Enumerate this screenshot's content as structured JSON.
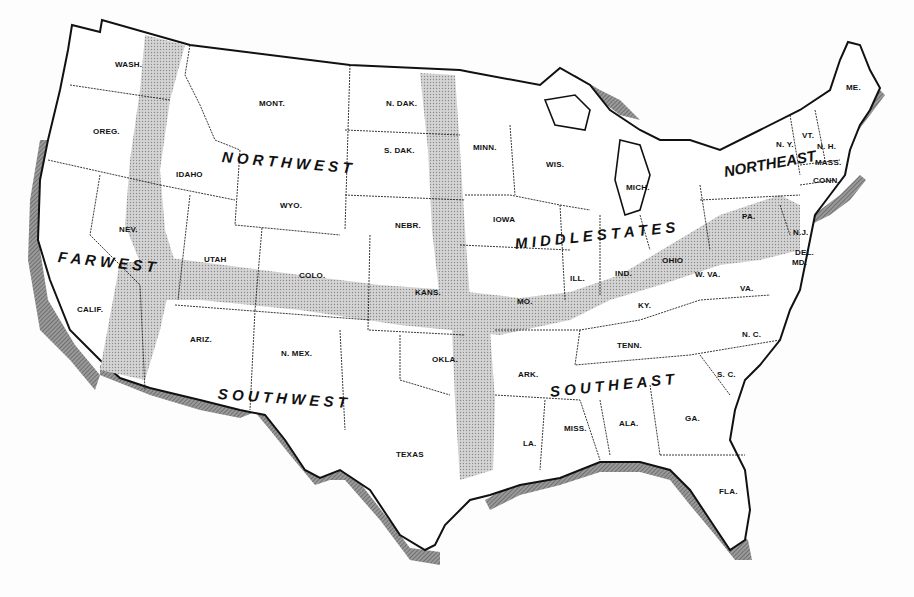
{
  "map": {
    "title": "",
    "colors": {
      "land": "#ffffff",
      "border": "#111111",
      "transition_band": "#c8c8c8",
      "water_shading": "#888888",
      "background": "#fdfdfd"
    },
    "regions": [
      {
        "id": "northwest",
        "label": "N O R T H W E S T",
        "x": 222,
        "y": 148,
        "rotate": 5
      },
      {
        "id": "far_west",
        "label": "F A R  W E S T",
        "x": 58,
        "y": 248,
        "rotate": 6
      },
      {
        "id": "southwest",
        "label": "S O U T H W E S T",
        "x": 218,
        "y": 385,
        "rotate": 4
      },
      {
        "id": "middle_states",
        "label": "M I D D L E   S T A T E S",
        "x": 515,
        "y": 235,
        "rotate": -6
      },
      {
        "id": "southeast",
        "label": "S O U T H E A S T",
        "x": 550,
        "y": 383,
        "rotate": -6
      },
      {
        "id": "northeast",
        "label": "NORTHEAST",
        "x": 724,
        "y": 163,
        "rotate": -10
      }
    ],
    "states": [
      {
        "label": "WASH.",
        "x": 115,
        "y": 60
      },
      {
        "label": "OREG.",
        "x": 93,
        "y": 127
      },
      {
        "label": "IDAHO",
        "x": 176,
        "y": 170
      },
      {
        "label": "MONT.",
        "x": 259,
        "y": 99
      },
      {
        "label": "N. DAK.",
        "x": 386,
        "y": 99
      },
      {
        "label": "S. DAK.",
        "x": 384,
        "y": 146
      },
      {
        "label": "WYO.",
        "x": 280,
        "y": 201
      },
      {
        "label": "NEBR.",
        "x": 395,
        "y": 221
      },
      {
        "label": "NEV.",
        "x": 119,
        "y": 225
      },
      {
        "label": "UTAH",
        "x": 204,
        "y": 255
      },
      {
        "label": "COLO.",
        "x": 299,
        "y": 271
      },
      {
        "label": "KANS.",
        "x": 415,
        "y": 288
      },
      {
        "label": "CALIF.",
        "x": 77,
        "y": 305
      },
      {
        "label": "ARIZ.",
        "x": 190,
        "y": 335
      },
      {
        "label": "N. MEX.",
        "x": 281,
        "y": 349
      },
      {
        "label": "OKLA.",
        "x": 432,
        "y": 355
      },
      {
        "label": "TEXAS",
        "x": 396,
        "y": 450
      },
      {
        "label": "MINN.",
        "x": 473,
        "y": 143
      },
      {
        "label": "WIS.",
        "x": 546,
        "y": 160
      },
      {
        "label": "MICH.",
        "x": 626,
        "y": 183
      },
      {
        "label": "IOWA",
        "x": 493,
        "y": 215
      },
      {
        "label": "ILL.",
        "x": 570,
        "y": 274
      },
      {
        "label": "IND.",
        "x": 615,
        "y": 269
      },
      {
        "label": "OHIO",
        "x": 662,
        "y": 256
      },
      {
        "label": "W. VA.",
        "x": 695,
        "y": 270
      },
      {
        "label": "VA.",
        "x": 740,
        "y": 284
      },
      {
        "label": "MO.",
        "x": 517,
        "y": 297
      },
      {
        "label": "KY.",
        "x": 638,
        "y": 301
      },
      {
        "label": "PA.",
        "x": 742,
        "y": 212
      },
      {
        "label": "N.J.",
        "x": 793,
        "y": 228
      },
      {
        "label": "DEL.",
        "x": 795,
        "y": 248
      },
      {
        "label": "MD.",
        "x": 792,
        "y": 258
      },
      {
        "label": "N. Y.",
        "x": 776,
        "y": 140
      },
      {
        "label": "VT.",
        "x": 802,
        "y": 131
      },
      {
        "label": "N. H.",
        "x": 817,
        "y": 142
      },
      {
        "label": "MASS.",
        "x": 815,
        "y": 158
      },
      {
        "label": "CONN.",
        "x": 813,
        "y": 176
      },
      {
        "label": "ME.",
        "x": 846,
        "y": 83
      },
      {
        "label": "ARK.",
        "x": 518,
        "y": 370
      },
      {
        "label": "TENN.",
        "x": 617,
        "y": 341
      },
      {
        "label": "N. C.",
        "x": 742,
        "y": 330
      },
      {
        "label": "S. C.",
        "x": 717,
        "y": 370
      },
      {
        "label": "LA.",
        "x": 523,
        "y": 439
      },
      {
        "label": "MISS.",
        "x": 564,
        "y": 424
      },
      {
        "label": "ALA.",
        "x": 619,
        "y": 419
      },
      {
        "label": "GA.",
        "x": 685,
        "y": 414
      },
      {
        "label": "FLA.",
        "x": 719,
        "y": 487
      }
    ]
  }
}
